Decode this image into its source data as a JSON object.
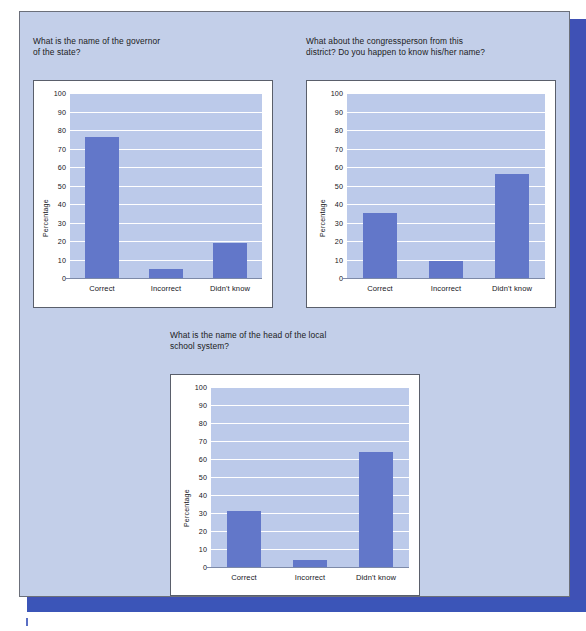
{
  "figure": {
    "background_color": "#c3cfe9",
    "card_color": "#ffffff",
    "bar_color": "#6277c9",
    "plot_background_color": "#bccaea",
    "grid_color": "#ffffff",
    "accent_bar_color": "#3b55b8"
  },
  "charts": [
    {
      "id": "governor",
      "title": "What is the name of the governor\nof the state?",
      "chart_data": {
        "type": "bar",
        "title": "What is the name of the governor of the state?",
        "categories": [
          "Correct",
          "Incorrect",
          "Didn't know"
        ],
        "values": [
          76,
          5,
          19
        ],
        "xlabel": "",
        "ylabel": "Percentage",
        "ylim": [
          0,
          100
        ],
        "yticks": [
          0,
          10,
          20,
          30,
          40,
          50,
          60,
          70,
          80,
          90,
          100
        ],
        "grid": true,
        "legend": "none"
      }
    },
    {
      "id": "congressperson",
      "title": "What about the congressperson from this\ndistrict? Do you happen to know his/her name?",
      "chart_data": {
        "type": "bar",
        "title": "What about the congressperson from this district? Do you happen to know his/her name?",
        "categories": [
          "Correct",
          "Incorrect",
          "Didn't know"
        ],
        "values": [
          35,
          9,
          56
        ],
        "xlabel": "",
        "ylabel": "Percentage",
        "ylim": [
          0,
          100
        ],
        "yticks": [
          0,
          10,
          20,
          30,
          40,
          50,
          60,
          70,
          80,
          90,
          100
        ],
        "grid": true,
        "legend": "none"
      }
    },
    {
      "id": "school-head",
      "title": "What is the name of the head of the local\nschool system?",
      "chart_data": {
        "type": "bar",
        "title": "What is the name of the head of the local school system?",
        "categories": [
          "Correct",
          "Incorrect",
          "Didn't know"
        ],
        "values": [
          31,
          4,
          64
        ],
        "xlabel": "",
        "ylabel": "Percentage",
        "ylim": [
          0,
          100
        ],
        "yticks": [
          0,
          10,
          20,
          30,
          40,
          50,
          60,
          70,
          80,
          90,
          100
        ],
        "grid": true,
        "legend": "none"
      }
    }
  ]
}
